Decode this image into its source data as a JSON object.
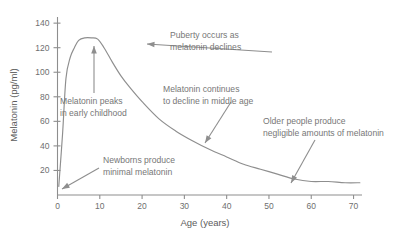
{
  "chart_data": {
    "type": "line",
    "title": "",
    "xlabel": "Age (years)",
    "ylabel": "Melatonin (pg/ml)",
    "xlim": [
      0,
      72
    ],
    "ylim": [
      0,
      145
    ],
    "xticks": [
      0,
      10,
      20,
      30,
      40,
      50,
      60,
      70
    ],
    "yticks": [
      20,
      40,
      60,
      80,
      100,
      120,
      140
    ],
    "grid": false,
    "legend": "none",
    "series": [
      {
        "name": "Melatonin level",
        "x": [
          0.3,
          1.2,
          2.0,
          3.0,
          4.0,
          5.0,
          6.5,
          8.0,
          9.5,
          11.0,
          13.0,
          15.0,
          17.0,
          20.0,
          24.0,
          28.0,
          32.0,
          36.0,
          40.0,
          44.0,
          48.0,
          52.0,
          56.0,
          60.0,
          64.0,
          68.0,
          71.5
        ],
        "y": [
          7,
          50,
          95,
          112,
          120,
          126,
          128,
          128,
          127,
          120,
          108,
          97,
          88,
          76,
          62,
          52,
          44,
          37,
          31,
          25,
          21,
          17,
          13,
          11,
          11,
          10,
          10
        ]
      }
    ],
    "annotations": [
      {
        "id": "peak-childhood",
        "line1": "Melatonin peaks",
        "line2": "in early childhood",
        "text_x": 60,
        "text_y": 104,
        "arrow": {
          "x1": 94,
          "y1": 93,
          "x2": 94,
          "y2": 46
        }
      },
      {
        "id": "puberty-decline",
        "line1": "Puberty occurs as",
        "line2": "melatonin declines",
        "text_x": 170,
        "text_y": 38,
        "arrow": {
          "x1": 272,
          "y1": 52,
          "x2": 147,
          "y2": 44
        }
      },
      {
        "id": "middle-age-decline",
        "line1": "Melatonin continues",
        "line2": "to decline in middle age",
        "text_x": 163,
        "text_y": 92,
        "arrow": {
          "x1": 231,
          "y1": 102,
          "x2": 205,
          "y2": 143
        }
      },
      {
        "id": "older-people-negligible",
        "line1": "Older people produce",
        "line2": "negligible amounts of melatonin",
        "text_x": 263,
        "text_y": 124,
        "arrow": {
          "x1": 315,
          "y1": 140,
          "x2": 291,
          "y2": 183
        }
      },
      {
        "id": "newborns-minimal",
        "line1": "Newborns produce",
        "line2": "minimal melatonin",
        "text_x": 103,
        "text_y": 163,
        "arrow": {
          "x1": 99,
          "y1": 168,
          "x2": 62,
          "y2": 189
        }
      }
    ]
  },
  "colors": {
    "curve": "#8e8e8e",
    "axis": "#8e8e8e",
    "tick_label": "#6f6f6f",
    "annotation": "#777777",
    "background": "#ffffff"
  }
}
